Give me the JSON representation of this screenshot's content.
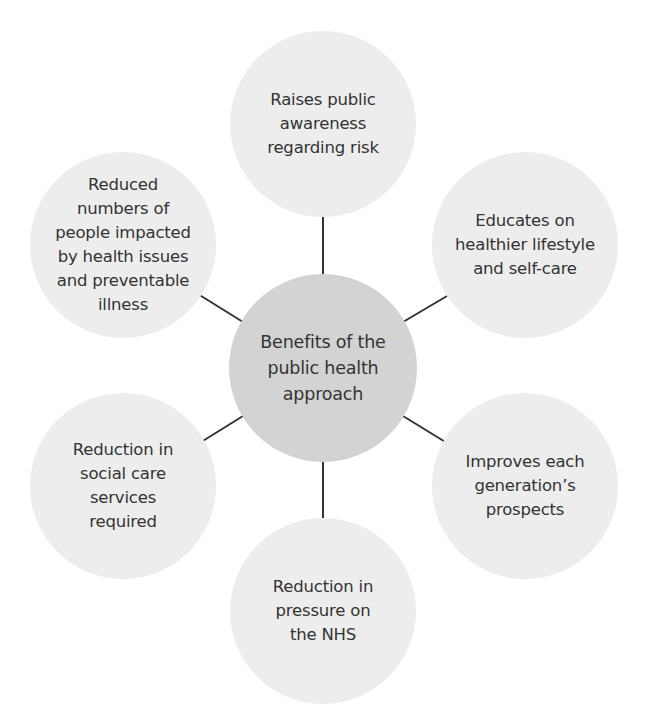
{
  "diagram": {
    "type": "hub-and-spoke",
    "center": {
      "label": "Benefits of the\npublic health\napproach",
      "fill": "#d3d3d3"
    },
    "spokes": [
      {
        "id": "top",
        "label": "Raises public\nawareness\nregarding risk"
      },
      {
        "id": "upper-right",
        "label": "Educates on\nhealthier lifestyle\nand self-care"
      },
      {
        "id": "lower-right",
        "label": "Improves each\ngeneration’s\nprospects"
      },
      {
        "id": "bottom",
        "label": "Reduction in\npressure on\nthe NHS"
      },
      {
        "id": "lower-left",
        "label": "Reduction in\nsocial care\nservices\nrequired"
      },
      {
        "id": "upper-left",
        "label": "Reduced\nnumbers of\npeople impacted\nby health issues\nand preventable\nillness"
      }
    ],
    "spoke_fill": "#ededed",
    "connector_color": "#333333"
  }
}
